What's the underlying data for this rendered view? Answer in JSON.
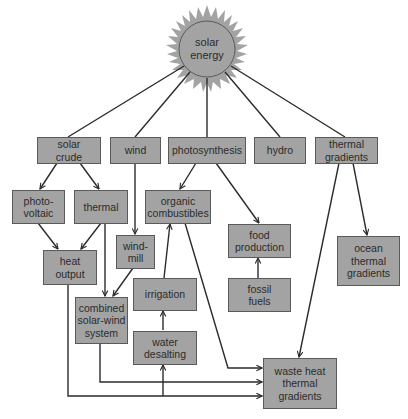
{
  "diagram": {
    "title": "solar energy",
    "colors": {
      "box_fill": "#a3a3a3",
      "box_border": "#5a5a5a",
      "line": "#2b2b2b",
      "sun_fill": "#a3a3a3",
      "background": "#ffffff"
    },
    "nodes": {
      "solar_energy": "solar\nenergy",
      "solar_crude": "solar\ncrude",
      "wind": "wind",
      "photosynthesis": "photosynthesis",
      "hydro": "hydro",
      "thermal_gradients": "thermal\ngradients",
      "photovoltaic": "photo-\nvoltaic",
      "thermal": "thermal",
      "organic_combustibles": "organic\ncombustibles",
      "food_production": "food\nproduction",
      "ocean_thermal_gradients": "ocean\nthermal\ngradients",
      "heat_output": "heat\noutput",
      "windmill": "wind-\nmill",
      "irrigation": "irrigation",
      "fossil_fuels": "fossil\nfuels",
      "combined_solar_wind_system": "combined\nsolar-wind\nsystem",
      "water_desalting": "water\ndesalting",
      "waste_heat_thermal_gradients": "waste heat\nthermal\ngradients"
    },
    "edges": [
      {
        "from": "solar energy",
        "to": "solar crude"
      },
      {
        "from": "solar energy",
        "to": "wind"
      },
      {
        "from": "solar energy",
        "to": "photosynthesis"
      },
      {
        "from": "solar energy",
        "to": "hydro"
      },
      {
        "from": "solar energy",
        "to": "thermal gradients"
      },
      {
        "from": "solar crude",
        "to": "photo-voltaic"
      },
      {
        "from": "solar crude",
        "to": "thermal"
      },
      {
        "from": "photosynthesis",
        "to": "organic combustibles"
      },
      {
        "from": "photosynthesis",
        "to": "food production"
      },
      {
        "from": "thermal gradients",
        "to": "ocean thermal gradients"
      },
      {
        "from": "thermal gradients",
        "to": "waste heat thermal gradients"
      },
      {
        "from": "photo-voltaic",
        "to": "heat output"
      },
      {
        "from": "thermal",
        "to": "heat output"
      },
      {
        "from": "thermal",
        "to": "combined solar-wind system"
      },
      {
        "from": "wind",
        "to": "wind-mill"
      },
      {
        "from": "wind-mill",
        "to": "combined solar-wind system"
      },
      {
        "from": "irrigation",
        "to": "organic combustibles"
      },
      {
        "from": "water desalting",
        "to": "irrigation"
      },
      {
        "from": "fossil fuels",
        "to": "food production"
      },
      {
        "from": "organic combustibles",
        "to": "waste heat thermal gradients"
      },
      {
        "from": "combined solar-wind system",
        "to": "waste heat thermal gradients"
      },
      {
        "from": "heat output",
        "to": "waste heat thermal gradients"
      },
      {
        "from": "heat output",
        "to": "water desalting"
      }
    ]
  }
}
